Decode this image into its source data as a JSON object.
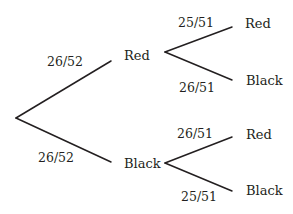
{
  "diagram": {
    "type": "probability-tree",
    "root": {
      "branches": [
        {
          "label": "Red",
          "probability": "26/52",
          "children": [
            {
              "label": "Red",
              "probability": "25/51"
            },
            {
              "label": "Black",
              "probability": "26/51"
            }
          ]
        },
        {
          "label": "Black",
          "probability": "26/52",
          "children": [
            {
              "label": "Red",
              "probability": "26/51"
            },
            {
              "label": "Black",
              "probability": "25/51"
            }
          ]
        }
      ]
    },
    "line_color": "#231f20",
    "text_color": "#231f20"
  }
}
